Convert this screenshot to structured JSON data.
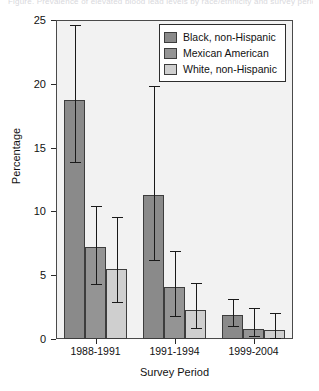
{
  "caption": {
    "text": "Figure. Prevalence of elevated blood lead levels by race/ethnicity and survey period"
  },
  "chart_data": {
    "type": "bar",
    "title": "",
    "xlabel": "Survey Period",
    "ylabel": "Percentage",
    "categories": [
      "1988-1991",
      "1991-1994",
      "1999-2004"
    ],
    "ylim": [
      0,
      25
    ],
    "yticks": [
      0,
      5,
      10,
      15,
      20,
      25
    ],
    "ytick_labels": [
      "0",
      "5",
      "10",
      "15",
      "20",
      "25"
    ],
    "grid": false,
    "legend_position": "top-right",
    "error_bars": "95% confidence interval",
    "series": [
      {
        "name": "Black, non-Hispanic",
        "color": "#8a8a8a",
        "values": [
          18.7,
          11.3,
          1.9
        ],
        "err_low": [
          13.9,
          6.2,
          1.0
        ],
        "err_high": [
          24.6,
          19.8,
          3.1
        ]
      },
      {
        "name": "Mexican American",
        "color": "#949494",
        "values": [
          7.2,
          4.1,
          0.8
        ],
        "err_low": [
          4.3,
          1.8,
          0.2
        ],
        "err_high": [
          10.4,
          6.9,
          2.4
        ]
      },
      {
        "name": "White, non-Hispanic",
        "color": "#cfcfcf",
        "values": [
          5.5,
          2.3,
          0.7
        ],
        "err_low": [
          2.9,
          0.9,
          0.1
        ],
        "err_high": [
          9.6,
          4.4,
          2.0
        ]
      }
    ]
  }
}
